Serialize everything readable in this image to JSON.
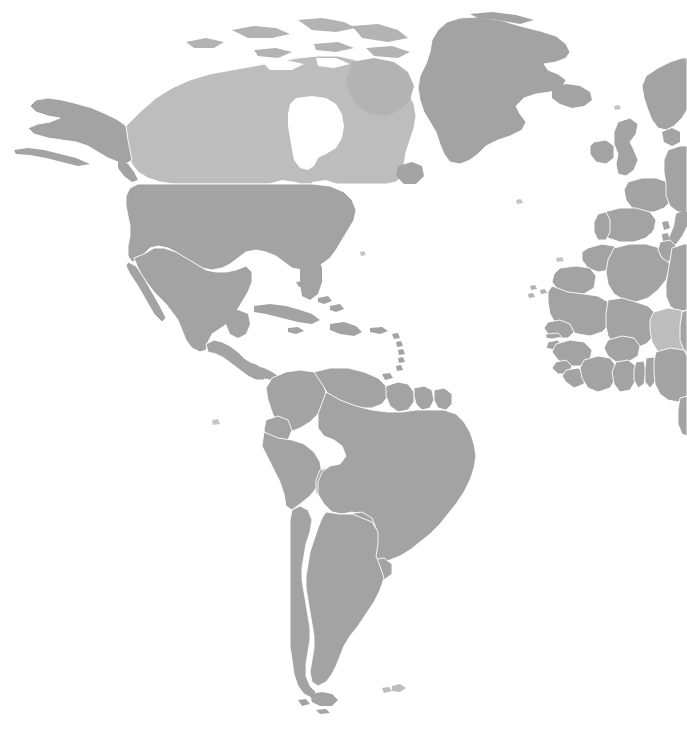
{
  "map": {
    "title": "World Map",
    "projection": "robinson",
    "view": {
      "width": 687,
      "height": 729
    },
    "colors": {
      "ocean": "#ffffff",
      "land_default": "#a3a3a3",
      "land_light": "#bdbdbd",
      "border": "#ffffff",
      "background": "#ffffff"
    },
    "legend_visible": false,
    "labels_visible": false,
    "graticule_visible": false,
    "center_region": "Americas",
    "visible_regions": [
      "North America",
      "Central America",
      "Caribbean",
      "South America",
      "Greenland",
      "Iceland",
      "Western Europe",
      "Northern Europe",
      "North Africa",
      "West Africa"
    ],
    "shading": {
      "light_countries": [
        "Canada",
        "Niger"
      ],
      "default_countries_note": "all other landmasses use land_default"
    },
    "features": [
      {
        "id": "greenland",
        "name": "Greenland",
        "shade": "default"
      },
      {
        "id": "canada",
        "name": "Canada",
        "shade": "light"
      },
      {
        "id": "alaska",
        "name": "Alaska",
        "shade": "default"
      },
      {
        "id": "united-states",
        "name": "United States",
        "shade": "default"
      },
      {
        "id": "mexico",
        "name": "Mexico",
        "shade": "default"
      },
      {
        "id": "central-america",
        "name": "Central America",
        "shade": "default"
      },
      {
        "id": "cuba",
        "name": "Cuba",
        "shade": "default"
      },
      {
        "id": "hispaniola",
        "name": "Hispaniola",
        "shade": "default"
      },
      {
        "id": "jamaica",
        "name": "Jamaica",
        "shade": "default"
      },
      {
        "id": "puerto-rico",
        "name": "Puerto Rico",
        "shade": "default"
      },
      {
        "id": "bahamas",
        "name": "Bahamas",
        "shade": "default"
      },
      {
        "id": "lesser-antilles",
        "name": "Lesser Antilles",
        "shade": "default"
      },
      {
        "id": "colombia",
        "name": "Colombia",
        "shade": "default"
      },
      {
        "id": "venezuela",
        "name": "Venezuela",
        "shade": "default"
      },
      {
        "id": "guyana",
        "name": "Guyana",
        "shade": "default"
      },
      {
        "id": "suriname",
        "name": "Suriname",
        "shade": "default"
      },
      {
        "id": "french-guiana",
        "name": "French Guiana",
        "shade": "default"
      },
      {
        "id": "ecuador",
        "name": "Ecuador",
        "shade": "default"
      },
      {
        "id": "peru",
        "name": "Peru",
        "shade": "default"
      },
      {
        "id": "brazil",
        "name": "Brazil",
        "shade": "default"
      },
      {
        "id": "bolivia",
        "name": "Bolivia",
        "shade": "default"
      },
      {
        "id": "paraguay",
        "name": "Paraguay",
        "shade": "default"
      },
      {
        "id": "uruguay",
        "name": "Uruguay",
        "shade": "default"
      },
      {
        "id": "chile",
        "name": "Chile",
        "shade": "default"
      },
      {
        "id": "argentina",
        "name": "Argentina",
        "shade": "default"
      },
      {
        "id": "falkland-islands",
        "name": "Falkland Islands",
        "shade": "default"
      },
      {
        "id": "iceland",
        "name": "Iceland",
        "shade": "default"
      },
      {
        "id": "ireland",
        "name": "Ireland",
        "shade": "default"
      },
      {
        "id": "united-kingdom",
        "name": "United Kingdom",
        "shade": "default"
      },
      {
        "id": "norway-sweden",
        "name": "Norway and Sweden",
        "shade": "default"
      },
      {
        "id": "france",
        "name": "France",
        "shade": "default"
      },
      {
        "id": "spain",
        "name": "Spain",
        "shade": "default"
      },
      {
        "id": "portugal",
        "name": "Portugal",
        "shade": "default"
      },
      {
        "id": "italy",
        "name": "Italy",
        "shade": "default"
      },
      {
        "id": "central-europe",
        "name": "Central Europe",
        "shade": "default"
      },
      {
        "id": "morocco",
        "name": "Morocco",
        "shade": "default"
      },
      {
        "id": "western-sahara",
        "name": "Western Sahara",
        "shade": "default"
      },
      {
        "id": "algeria",
        "name": "Algeria",
        "shade": "default"
      },
      {
        "id": "tunisia",
        "name": "Tunisia",
        "shade": "default"
      },
      {
        "id": "libya",
        "name": "Libya",
        "shade": "default"
      },
      {
        "id": "mauritania",
        "name": "Mauritania",
        "shade": "default"
      },
      {
        "id": "mali",
        "name": "Mali",
        "shade": "default"
      },
      {
        "id": "niger",
        "name": "Niger",
        "shade": "light"
      },
      {
        "id": "senegal",
        "name": "Senegal",
        "shade": "default"
      },
      {
        "id": "guinea",
        "name": "Guinea",
        "shade": "default"
      },
      {
        "id": "sierra-leone",
        "name": "Sierra Leone",
        "shade": "default"
      },
      {
        "id": "liberia",
        "name": "Liberia",
        "shade": "default"
      },
      {
        "id": "ivory-coast",
        "name": "Ivory Coast",
        "shade": "default"
      },
      {
        "id": "ghana",
        "name": "Ghana",
        "shade": "default"
      },
      {
        "id": "togo-benin",
        "name": "Togo and Benin",
        "shade": "default"
      },
      {
        "id": "burkina-faso",
        "name": "Burkina Faso",
        "shade": "default"
      },
      {
        "id": "nigeria",
        "name": "Nigeria",
        "shade": "default"
      },
      {
        "id": "cameroon",
        "name": "Cameroon",
        "shade": "default"
      },
      {
        "id": "chad",
        "name": "Chad",
        "shade": "default"
      }
    ]
  }
}
